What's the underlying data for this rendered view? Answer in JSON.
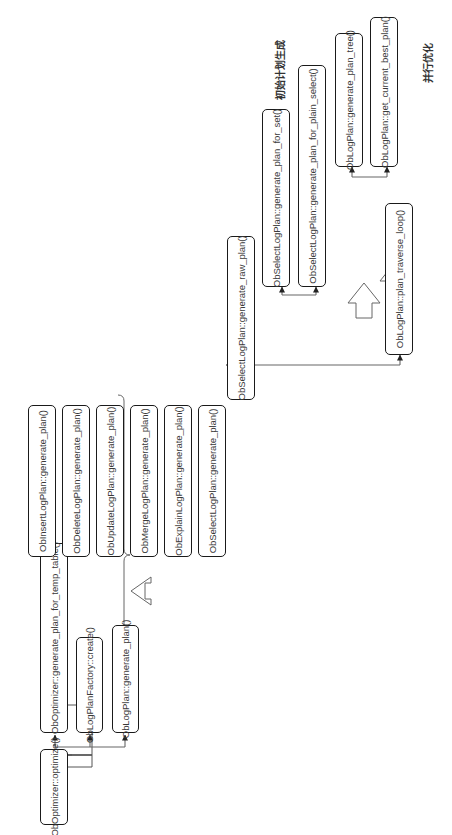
{
  "diagram": {
    "nodes": {
      "optimize": "ObOptimizer::optimize()",
      "gen_plan_temp_table": "ObOptimizer::generate_plan_for_temp_table()",
      "factory_create": "ObLogPlanFactory::create()",
      "logplan_generate_plan": "ObLogPlan::generate_plan()",
      "insert_generate_plan": "ObInsertLogPlan::generate_plan()",
      "delete_generate_plan": "ObDeleteLogPlan::generate_plan()",
      "update_generate_plan": "ObUpdateLogPlan::generate_plan()",
      "merge_generate_plan": "ObMergeLogPlan::generate_plan()",
      "explain_generate_plan": "ObExplainLogPlan::generate_plan()",
      "select_generate_plan": "ObSelectLogPlan::generate_plan()",
      "select_generate_raw_plan": "ObSelectLogPlan::generate_raw_plan()",
      "select_generate_plan_for_set": "ObSelectLogPlan::generate_plan_for_set()",
      "select_generate_plan_for_plain_select": "ObSelectLogPlan::generate_plan_for_plain_select()",
      "logplan_generate_plan_tree": "ObLogPlan::generate_plan_tree()",
      "logplan_get_current_best_plan": "ObLogPlan::get_current_best_plan()",
      "logplan_plan_traverse_loop": "ObLogPlan::plan_traverse_loop()"
    },
    "labels": {
      "initial_plan_generation": "初始计划生成",
      "parallel_optimization": "并行优化"
    },
    "colors": {
      "box_border": "#1a1a1a",
      "connector": "#555555",
      "text": "#3a3a3a",
      "background": "#ffffff"
    }
  }
}
